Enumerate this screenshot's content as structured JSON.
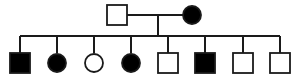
{
  "diagram": {
    "type": "pedigree",
    "background_color": "#ffffff",
    "line_color": "#1a1a1a",
    "affected_fill": "#000000",
    "unaffected_fill": "#ffffff",
    "generations": 2,
    "shape_legend": {
      "square": "male",
      "circle": "female",
      "filled": "affected",
      "open": "unaffected"
    }
  },
  "generation_1": {
    "label": "I",
    "mating_line": {
      "x1": 127,
      "x2": 185,
      "y": 15
    },
    "descent_line": {
      "x": 158,
      "y1": 15,
      "y2": 36
    },
    "individuals": [
      {
        "id": "I-1",
        "shape": "square",
        "sex": "male",
        "status": "unaffected",
        "fill": "#ffffff",
        "cx": 117,
        "cy": 15,
        "size": 20
      },
      {
        "id": "I-2",
        "shape": "circle",
        "sex": "female",
        "status": "affected",
        "fill": "#000000",
        "cx": 192,
        "cy": 15,
        "size": 18
      }
    ]
  },
  "generation_2": {
    "label": "II",
    "sibship_line": {
      "x1": 20,
      "x2": 280,
      "y": 36
    },
    "drop_y1": 36,
    "drop_y2": 53,
    "individuals": [
      {
        "id": "II-1",
        "shape": "square",
        "sex": "male",
        "status": "affected",
        "fill": "#000000",
        "cx": 20,
        "cy": 63,
        "size": 20
      },
      {
        "id": "II-2",
        "shape": "circle",
        "sex": "female",
        "status": "affected",
        "fill": "#000000",
        "cx": 57,
        "cy": 63,
        "size": 18
      },
      {
        "id": "II-3",
        "shape": "circle",
        "sex": "female",
        "status": "unaffected",
        "fill": "#ffffff",
        "cx": 94,
        "cy": 63,
        "size": 18
      },
      {
        "id": "II-4",
        "shape": "circle",
        "sex": "female",
        "status": "affected",
        "fill": "#000000",
        "cx": 131,
        "cy": 63,
        "size": 18
      },
      {
        "id": "II-5",
        "shape": "square",
        "sex": "male",
        "status": "unaffected",
        "fill": "#ffffff",
        "cx": 168,
        "cy": 63,
        "size": 20
      },
      {
        "id": "II-6",
        "shape": "square",
        "sex": "male",
        "status": "affected",
        "fill": "#000000",
        "cx": 205,
        "cy": 63,
        "size": 20
      },
      {
        "id": "II-7",
        "shape": "square",
        "sex": "male",
        "status": "unaffected",
        "fill": "#ffffff",
        "cx": 243,
        "cy": 63,
        "size": 20
      },
      {
        "id": "II-8",
        "shape": "square",
        "sex": "male",
        "status": "unaffected",
        "fill": "#ffffff",
        "cx": 280,
        "cy": 63,
        "size": 20
      }
    ]
  }
}
